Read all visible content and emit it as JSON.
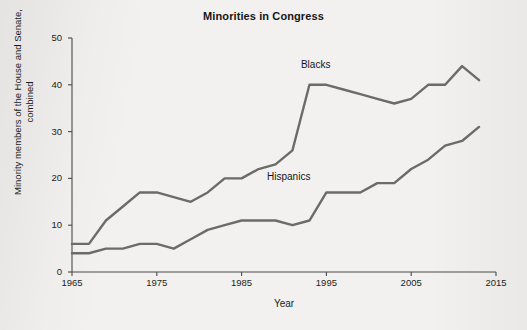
{
  "chart_data": {
    "type": "line",
    "title": "Minorities in Congress",
    "xlabel": "Year",
    "ylabel": "Minority members of the House and Senate, combined",
    "xlim": [
      1965,
      2015
    ],
    "ylim": [
      0,
      50
    ],
    "xticks": [
      1965,
      1975,
      1985,
      1995,
      2005,
      2015
    ],
    "yticks": [
      0,
      10,
      20,
      30,
      40,
      50
    ],
    "grid": false,
    "legend": "inline-labels",
    "line_color": "#6b6b6b",
    "axis_color": "#4a4a4a",
    "background": "#f2f1ef",
    "x": [
      1965,
      1967,
      1969,
      1971,
      1973,
      1975,
      1977,
      1979,
      1981,
      1983,
      1985,
      1987,
      1989,
      1991,
      1993,
      1995,
      1997,
      1999,
      2001,
      2003,
      2005,
      2007,
      2009,
      2011,
      2013
    ],
    "series": [
      {
        "name": "Blacks",
        "label_x": 1992,
        "label_y": 44,
        "values": [
          6,
          6,
          11,
          14,
          17,
          17,
          16,
          15,
          17,
          20,
          20,
          22,
          23,
          26,
          40,
          40,
          39,
          38,
          37,
          36,
          37,
          40,
          40,
          44,
          41
        ]
      },
      {
        "name": "Hispanics",
        "label_x": 1988,
        "label_y": 20,
        "values": [
          4,
          4,
          5,
          5,
          6,
          6,
          5,
          7,
          9,
          10,
          11,
          11,
          11,
          10,
          11,
          17,
          17,
          17,
          19,
          19,
          22,
          24,
          27,
          28,
          31
        ]
      }
    ]
  }
}
